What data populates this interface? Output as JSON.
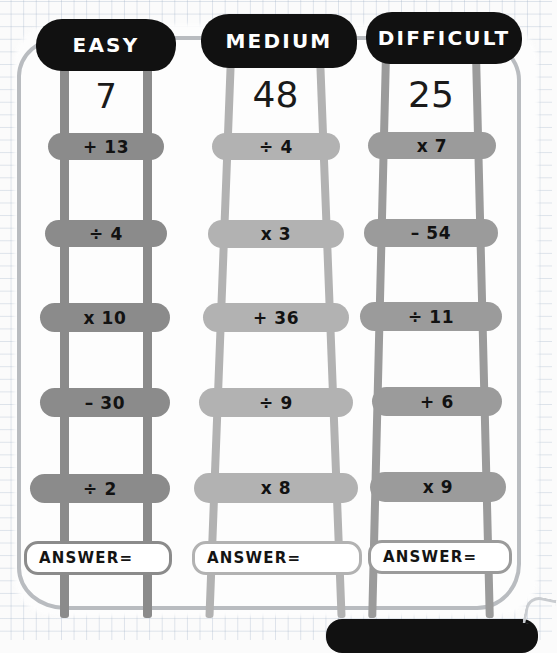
{
  "page": {
    "background": "graph-paper",
    "frame_color": "#b9bcc0",
    "accent_dark": "#111111"
  },
  "columns": [
    {
      "id": "easy",
      "title": "EASY",
      "title_bg": "#111111",
      "title_color": "#ffffff",
      "start_number": "7",
      "rail_color": "#8b8b8b",
      "rung_color": "#8b8b8b",
      "steps": [
        "+ 13",
        "÷ 4",
        "x 10",
        "– 30",
        "÷ 2"
      ],
      "answer_label": "ANSWER=",
      "answer_value": ""
    },
    {
      "id": "medium",
      "title": "MEDIUM",
      "title_bg": "#111111",
      "title_color": "#ffffff",
      "start_number": "48",
      "rail_color": "#b2b2b2",
      "rung_color": "#b2b2b2",
      "steps": [
        "÷ 4",
        "x 3",
        "+ 36",
        "÷ 9",
        "x 8"
      ],
      "answer_label": "ANSWER=",
      "answer_value": ""
    },
    {
      "id": "difficult",
      "title": "DIFFICULT",
      "title_bg": "#111111",
      "title_color": "#ffffff",
      "start_number": "25",
      "rail_color": "#9b9b9b",
      "rung_color": "#9b9b9b",
      "steps": [
        "x 7",
        "– 54",
        "÷ 11",
        "+ 6",
        "x 9"
      ],
      "answer_label": "ANSWER=",
      "answer_value": ""
    }
  ]
}
